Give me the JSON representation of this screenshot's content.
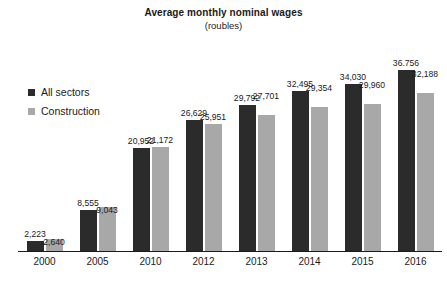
{
  "chart_data": {
    "type": "bar",
    "title": "Average monthly nominal wages",
    "subtitle": "(roubles)",
    "xlabel": "",
    "ylabel": "",
    "ylim": [
      0,
      40000
    ],
    "grid": false,
    "legend_position": "inside-top-left",
    "categories": [
      "2000",
      "2005",
      "2010",
      "2012",
      "2013",
      "2014",
      "2015",
      "2016"
    ],
    "series": [
      {
        "name": "All sectors",
        "color": "#2b2b2b",
        "values": [
          2223,
          8555,
          20952,
          26629,
          29792,
          32495,
          34030,
          36756
        ],
        "labels": [
          "2,223",
          "8,555",
          "20,952",
          "26,629",
          "29,792",
          "32,495",
          "34,030",
          "36.756"
        ]
      },
      {
        "name": "Construction",
        "color": "#a8a8a8",
        "values": [
          2640,
          9043,
          21172,
          25951,
          27701,
          29354,
          29960,
          32188
        ],
        "labels": [
          "2,640",
          "9,043",
          "21,172",
          "25,951",
          "27,701",
          "29,354",
          "29,960",
          "32,188"
        ]
      }
    ]
  },
  "legend": {
    "items": [
      {
        "label": "All sectors",
        "color": "#2b2b2b"
      },
      {
        "label": "Construction",
        "color": "#a8a8a8"
      }
    ]
  }
}
